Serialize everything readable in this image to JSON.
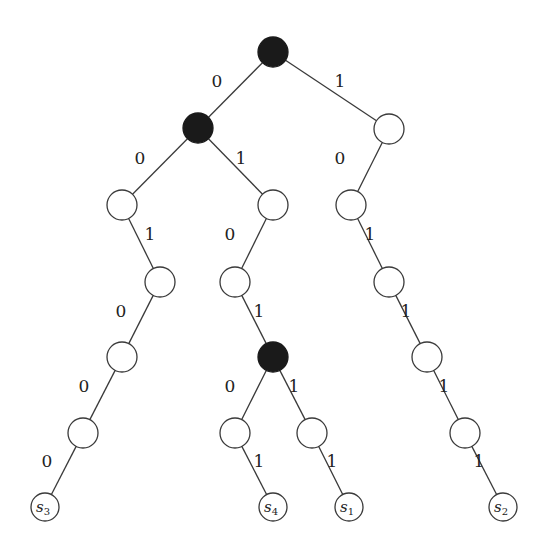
{
  "diagram": {
    "type": "binary-trie",
    "colors": {
      "filled": "#1a1a1a",
      "open": "#ffffff",
      "stroke": "#3a3a3a"
    },
    "nodes": [
      {
        "id": "root",
        "x": 273,
        "y": 52,
        "filled": true
      },
      {
        "id": "n0",
        "x": 198,
        "y": 128,
        "filled": true
      },
      {
        "id": "n1",
        "x": 389,
        "y": 129,
        "filled": false
      },
      {
        "id": "n00",
        "x": 122,
        "y": 205,
        "filled": false
      },
      {
        "id": "n01",
        "x": 273,
        "y": 205,
        "filled": false
      },
      {
        "id": "n10",
        "x": 351,
        "y": 205,
        "filled": false
      },
      {
        "id": "n001",
        "x": 160,
        "y": 282,
        "filled": false
      },
      {
        "id": "n010",
        "x": 235,
        "y": 282,
        "filled": false
      },
      {
        "id": "n101",
        "x": 389,
        "y": 282,
        "filled": false
      },
      {
        "id": "n0010",
        "x": 122,
        "y": 357,
        "filled": false
      },
      {
        "id": "n0101",
        "x": 273,
        "y": 357,
        "filled": true
      },
      {
        "id": "n1011",
        "x": 427,
        "y": 357,
        "filled": false
      },
      {
        "id": "n00100",
        "x": 83,
        "y": 433,
        "filled": false
      },
      {
        "id": "n01010",
        "x": 235,
        "y": 433,
        "filled": false
      },
      {
        "id": "n01011",
        "x": 312,
        "y": 433,
        "filled": false
      },
      {
        "id": "n10111",
        "x": 465,
        "y": 433,
        "filled": false
      }
    ],
    "leaves": [
      {
        "id": "s3",
        "label": "s",
        "sub": "3",
        "x": 45,
        "y": 507
      },
      {
        "id": "s4",
        "label": "s",
        "sub": "4",
        "x": 273,
        "y": 507
      },
      {
        "id": "s1",
        "label": "s",
        "sub": "1",
        "x": 349,
        "y": 507
      },
      {
        "id": "s2",
        "label": "s",
        "sub": "2",
        "x": 503,
        "y": 507
      }
    ],
    "edges": [
      {
        "from": "root",
        "to": "n0",
        "bit": "0",
        "lx": 217,
        "ly": 82
      },
      {
        "from": "root",
        "to": "n1",
        "bit": "1",
        "lx": 340,
        "ly": 82
      },
      {
        "from": "n0",
        "to": "n00",
        "bit": "0",
        "lx": 140,
        "ly": 159
      },
      {
        "from": "n0",
        "to": "n01",
        "bit": "1",
        "lx": 241,
        "ly": 159
      },
      {
        "from": "n1",
        "to": "n10",
        "bit": "0",
        "lx": 340,
        "ly": 159
      },
      {
        "from": "n00",
        "to": "n001",
        "bit": "1",
        "lx": 150,
        "ly": 235
      },
      {
        "from": "n01",
        "to": "n010",
        "bit": "0",
        "lx": 230,
        "ly": 235
      },
      {
        "from": "n10",
        "to": "n101",
        "bit": "1",
        "lx": 370,
        "ly": 235
      },
      {
        "from": "n001",
        "to": "n0010",
        "bit": "0",
        "lx": 121,
        "ly": 312
      },
      {
        "from": "n010",
        "to": "n0101",
        "bit": "1",
        "lx": 259,
        "ly": 312
      },
      {
        "from": "n101",
        "to": "n1011",
        "bit": "1",
        "lx": 406,
        "ly": 312
      },
      {
        "from": "n0010",
        "to": "n00100",
        "bit": "0",
        "lx": 84,
        "ly": 387
      },
      {
        "from": "n0101",
        "to": "n01010",
        "bit": "0",
        "lx": 230,
        "ly": 387
      },
      {
        "from": "n0101",
        "to": "n01011",
        "bit": "1",
        "lx": 294,
        "ly": 387
      },
      {
        "from": "n1011",
        "to": "n10111",
        "bit": "1",
        "lx": 444,
        "ly": 387
      },
      {
        "from": "n00100",
        "to": "s3",
        "bit": "0",
        "lx": 47,
        "ly": 462
      },
      {
        "from": "n01010",
        "to": "s4",
        "bit": "1",
        "lx": 259,
        "ly": 462
      },
      {
        "from": "n01011",
        "to": "s1",
        "bit": "1",
        "lx": 332,
        "ly": 462
      },
      {
        "from": "n10111",
        "to": "s2",
        "bit": "1",
        "lx": 479,
        "ly": 462
      }
    ],
    "node_radius": 15,
    "leaf_radius": 14
  }
}
